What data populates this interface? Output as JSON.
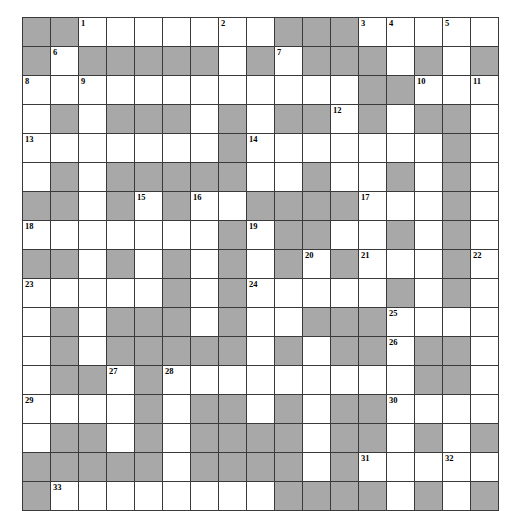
{
  "puzzle": {
    "type": "crossword-grid",
    "columns": 17,
    "rows": 15,
    "colors": {
      "block": "#a8a8a8",
      "open": "#ffffff",
      "grid_line": "#3a3a3a",
      "number_text": "#000000"
    },
    "max_clue_number": 33,
    "grid": [
      [
        {
          "block": true,
          "num": ""
        },
        {
          "block": true,
          "num": ""
        },
        {
          "block": false,
          "num": "1"
        },
        {
          "block": false,
          "num": ""
        },
        {
          "block": false,
          "num": ""
        },
        {
          "block": false,
          "num": ""
        },
        {
          "block": false,
          "num": ""
        },
        {
          "block": false,
          "num": "2"
        },
        {
          "block": false,
          "num": ""
        },
        {
          "block": true,
          "num": ""
        },
        {
          "block": true,
          "num": ""
        },
        {
          "block": true,
          "num": ""
        },
        {
          "block": false,
          "num": "3"
        },
        {
          "block": false,
          "num": "4"
        },
        {
          "block": false,
          "num": ""
        },
        {
          "block": false,
          "num": "5"
        },
        {
          "block": false,
          "num": ""
        }
      ],
      [
        {
          "block": true,
          "num": ""
        },
        {
          "block": false,
          "num": "6"
        },
        {
          "block": true,
          "num": ""
        },
        {
          "block": true,
          "num": ""
        },
        {
          "block": true,
          "num": ""
        },
        {
          "block": true,
          "num": ""
        },
        {
          "block": true,
          "num": ""
        },
        {
          "block": false,
          "num": ""
        },
        {
          "block": true,
          "num": ""
        },
        {
          "block": false,
          "num": "7"
        },
        {
          "block": true,
          "num": ""
        },
        {
          "block": true,
          "num": ""
        },
        {
          "block": true,
          "num": ""
        },
        {
          "block": false,
          "num": ""
        },
        {
          "block": true,
          "num": ""
        },
        {
          "block": false,
          "num": ""
        },
        {
          "block": true,
          "num": ""
        }
      ],
      [
        {
          "block": false,
          "num": "8"
        },
        {
          "block": false,
          "num": ""
        },
        {
          "block": false,
          "num": "9"
        },
        {
          "block": false,
          "num": ""
        },
        {
          "block": false,
          "num": ""
        },
        {
          "block": false,
          "num": ""
        },
        {
          "block": false,
          "num": ""
        },
        {
          "block": false,
          "num": ""
        },
        {
          "block": false,
          "num": ""
        },
        {
          "block": false,
          "num": ""
        },
        {
          "block": false,
          "num": ""
        },
        {
          "block": false,
          "num": ""
        },
        {
          "block": true,
          "num": ""
        },
        {
          "block": true,
          "num": ""
        },
        {
          "block": false,
          "num": "10"
        },
        {
          "block": false,
          "num": ""
        },
        {
          "block": false,
          "num": "11"
        }
      ],
      [
        {
          "block": false,
          "num": ""
        },
        {
          "block": true,
          "num": ""
        },
        {
          "block": false,
          "num": ""
        },
        {
          "block": true,
          "num": ""
        },
        {
          "block": true,
          "num": ""
        },
        {
          "block": true,
          "num": ""
        },
        {
          "block": false,
          "num": ""
        },
        {
          "block": true,
          "num": ""
        },
        {
          "block": false,
          "num": ""
        },
        {
          "block": true,
          "num": ""
        },
        {
          "block": true,
          "num": ""
        },
        {
          "block": false,
          "num": "12"
        },
        {
          "block": true,
          "num": ""
        },
        {
          "block": false,
          "num": ""
        },
        {
          "block": true,
          "num": ""
        },
        {
          "block": true,
          "num": ""
        },
        {
          "block": false,
          "num": ""
        }
      ],
      [
        {
          "block": false,
          "num": "13"
        },
        {
          "block": false,
          "num": ""
        },
        {
          "block": false,
          "num": ""
        },
        {
          "block": false,
          "num": ""
        },
        {
          "block": false,
          "num": ""
        },
        {
          "block": false,
          "num": ""
        },
        {
          "block": false,
          "num": ""
        },
        {
          "block": true,
          "num": ""
        },
        {
          "block": false,
          "num": "14"
        },
        {
          "block": false,
          "num": ""
        },
        {
          "block": false,
          "num": ""
        },
        {
          "block": false,
          "num": ""
        },
        {
          "block": false,
          "num": ""
        },
        {
          "block": false,
          "num": ""
        },
        {
          "block": false,
          "num": ""
        },
        {
          "block": true,
          "num": ""
        },
        {
          "block": false,
          "num": ""
        }
      ],
      [
        {
          "block": false,
          "num": ""
        },
        {
          "block": true,
          "num": ""
        },
        {
          "block": false,
          "num": ""
        },
        {
          "block": true,
          "num": ""
        },
        {
          "block": true,
          "num": ""
        },
        {
          "block": true,
          "num": ""
        },
        {
          "block": true,
          "num": ""
        },
        {
          "block": true,
          "num": ""
        },
        {
          "block": false,
          "num": ""
        },
        {
          "block": false,
          "num": ""
        },
        {
          "block": true,
          "num": ""
        },
        {
          "block": false,
          "num": ""
        },
        {
          "block": false,
          "num": ""
        },
        {
          "block": true,
          "num": ""
        },
        {
          "block": false,
          "num": ""
        },
        {
          "block": true,
          "num": ""
        },
        {
          "block": false,
          "num": ""
        }
      ],
      [
        {
          "block": true,
          "num": ""
        },
        {
          "block": true,
          "num": ""
        },
        {
          "block": false,
          "num": ""
        },
        {
          "block": true,
          "num": ""
        },
        {
          "block": false,
          "num": "15"
        },
        {
          "block": true,
          "num": ""
        },
        {
          "block": false,
          "num": "16"
        },
        {
          "block": false,
          "num": ""
        },
        {
          "block": true,
          "num": ""
        },
        {
          "block": true,
          "num": ""
        },
        {
          "block": true,
          "num": ""
        },
        {
          "block": true,
          "num": ""
        },
        {
          "block": false,
          "num": "17"
        },
        {
          "block": false,
          "num": ""
        },
        {
          "block": false,
          "num": ""
        },
        {
          "block": true,
          "num": ""
        },
        {
          "block": false,
          "num": ""
        }
      ],
      [
        {
          "block": false,
          "num": "18"
        },
        {
          "block": false,
          "num": ""
        },
        {
          "block": false,
          "num": ""
        },
        {
          "block": false,
          "num": ""
        },
        {
          "block": false,
          "num": ""
        },
        {
          "block": false,
          "num": ""
        },
        {
          "block": false,
          "num": ""
        },
        {
          "block": true,
          "num": ""
        },
        {
          "block": false,
          "num": "19"
        },
        {
          "block": true,
          "num": ""
        },
        {
          "block": true,
          "num": ""
        },
        {
          "block": false,
          "num": ""
        },
        {
          "block": false,
          "num": ""
        },
        {
          "block": true,
          "num": ""
        },
        {
          "block": false,
          "num": ""
        },
        {
          "block": true,
          "num": ""
        },
        {
          "block": false,
          "num": ""
        }
      ],
      [
        {
          "block": true,
          "num": ""
        },
        {
          "block": true,
          "num": ""
        },
        {
          "block": false,
          "num": ""
        },
        {
          "block": true,
          "num": ""
        },
        {
          "block": false,
          "num": ""
        },
        {
          "block": true,
          "num": ""
        },
        {
          "block": false,
          "num": ""
        },
        {
          "block": true,
          "num": ""
        },
        {
          "block": false,
          "num": ""
        },
        {
          "block": true,
          "num": ""
        },
        {
          "block": false,
          "num": "20"
        },
        {
          "block": true,
          "num": ""
        },
        {
          "block": false,
          "num": "21"
        },
        {
          "block": false,
          "num": ""
        },
        {
          "block": false,
          "num": ""
        },
        {
          "block": true,
          "num": ""
        },
        {
          "block": false,
          "num": "22"
        }
      ],
      [
        {
          "block": false,
          "num": "23"
        },
        {
          "block": false,
          "num": ""
        },
        {
          "block": false,
          "num": ""
        },
        {
          "block": false,
          "num": ""
        },
        {
          "block": false,
          "num": ""
        },
        {
          "block": true,
          "num": ""
        },
        {
          "block": false,
          "num": ""
        },
        {
          "block": true,
          "num": ""
        },
        {
          "block": false,
          "num": "24"
        },
        {
          "block": false,
          "num": ""
        },
        {
          "block": false,
          "num": ""
        },
        {
          "block": false,
          "num": ""
        },
        {
          "block": false,
          "num": ""
        },
        {
          "block": true,
          "num": ""
        },
        {
          "block": false,
          "num": ""
        },
        {
          "block": true,
          "num": ""
        },
        {
          "block": false,
          "num": ""
        }
      ],
      [
        {
          "block": false,
          "num": ""
        },
        {
          "block": true,
          "num": ""
        },
        {
          "block": false,
          "num": ""
        },
        {
          "block": true,
          "num": ""
        },
        {
          "block": true,
          "num": ""
        },
        {
          "block": true,
          "num": ""
        },
        {
          "block": false,
          "num": ""
        },
        {
          "block": true,
          "num": ""
        },
        {
          "block": false,
          "num": ""
        },
        {
          "block": false,
          "num": ""
        },
        {
          "block": true,
          "num": ""
        },
        {
          "block": true,
          "num": ""
        },
        {
          "block": true,
          "num": ""
        },
        {
          "block": false,
          "num": "25"
        },
        {
          "block": false,
          "num": ""
        },
        {
          "block": false,
          "num": ""
        },
        {
          "block": false,
          "num": ""
        }
      ],
      [
        {
          "block": false,
          "num": ""
        },
        {
          "block": true,
          "num": ""
        },
        {
          "block": false,
          "num": ""
        },
        {
          "block": true,
          "num": ""
        },
        {
          "block": true,
          "num": ""
        },
        {
          "block": true,
          "num": ""
        },
        {
          "block": true,
          "num": ""
        },
        {
          "block": true,
          "num": ""
        },
        {
          "block": false,
          "num": ""
        },
        {
          "block": true,
          "num": ""
        },
        {
          "block": false,
          "num": ""
        },
        {
          "block": true,
          "num": ""
        },
        {
          "block": true,
          "num": ""
        },
        {
          "block": false,
          "num": "26"
        },
        {
          "block": true,
          "num": ""
        },
        {
          "block": true,
          "num": ""
        },
        {
          "block": false,
          "num": ""
        }
      ],
      [
        {
          "block": false,
          "num": ""
        },
        {
          "block": true,
          "num": ""
        },
        {
          "block": true,
          "num": ""
        },
        {
          "block": false,
          "num": "27"
        },
        {
          "block": true,
          "num": ""
        },
        {
          "block": false,
          "num": "28"
        },
        {
          "block": false,
          "num": ""
        },
        {
          "block": false,
          "num": ""
        },
        {
          "block": false,
          "num": ""
        },
        {
          "block": false,
          "num": ""
        },
        {
          "block": false,
          "num": ""
        },
        {
          "block": false,
          "num": ""
        },
        {
          "block": false,
          "num": ""
        },
        {
          "block": false,
          "num": ""
        },
        {
          "block": true,
          "num": ""
        },
        {
          "block": true,
          "num": ""
        },
        {
          "block": false,
          "num": ""
        }
      ],
      [
        {
          "block": false,
          "num": "29"
        },
        {
          "block": false,
          "num": ""
        },
        {
          "block": false,
          "num": ""
        },
        {
          "block": false,
          "num": ""
        },
        {
          "block": true,
          "num": ""
        },
        {
          "block": false,
          "num": ""
        },
        {
          "block": true,
          "num": ""
        },
        {
          "block": true,
          "num": ""
        },
        {
          "block": false,
          "num": ""
        },
        {
          "block": true,
          "num": ""
        },
        {
          "block": false,
          "num": ""
        },
        {
          "block": true,
          "num": ""
        },
        {
          "block": true,
          "num": ""
        },
        {
          "block": false,
          "num": "30"
        },
        {
          "block": false,
          "num": ""
        },
        {
          "block": false,
          "num": ""
        },
        {
          "block": false,
          "num": ""
        }
      ],
      [
        {
          "block": false,
          "num": ""
        },
        {
          "block": true,
          "num": ""
        },
        {
          "block": true,
          "num": ""
        },
        {
          "block": false,
          "num": ""
        },
        {
          "block": true,
          "num": ""
        },
        {
          "block": false,
          "num": ""
        },
        {
          "block": true,
          "num": ""
        },
        {
          "block": true,
          "num": ""
        },
        {
          "block": true,
          "num": ""
        },
        {
          "block": true,
          "num": ""
        },
        {
          "block": false,
          "num": ""
        },
        {
          "block": true,
          "num": ""
        },
        {
          "block": true,
          "num": ""
        },
        {
          "block": false,
          "num": ""
        },
        {
          "block": true,
          "num": ""
        },
        {
          "block": false,
          "num": ""
        },
        {
          "block": true,
          "num": ""
        }
      ],
      [
        {
          "block": true,
          "num": ""
        },
        {
          "block": true,
          "num": ""
        },
        {
          "block": true,
          "num": ""
        },
        {
          "block": true,
          "num": ""
        },
        {
          "block": true,
          "num": ""
        },
        {
          "block": false,
          "num": ""
        },
        {
          "block": true,
          "num": ""
        },
        {
          "block": true,
          "num": ""
        },
        {
          "block": true,
          "num": ""
        },
        {
          "block": true,
          "num": ""
        },
        {
          "block": false,
          "num": ""
        },
        {
          "block": true,
          "num": ""
        },
        {
          "block": false,
          "num": "31"
        },
        {
          "block": false,
          "num": ""
        },
        {
          "block": false,
          "num": ""
        },
        {
          "block": false,
          "num": "32"
        },
        {
          "block": false,
          "num": ""
        }
      ],
      [
        {
          "block": true,
          "num": ""
        },
        {
          "block": false,
          "num": "33"
        },
        {
          "block": false,
          "num": ""
        },
        {
          "block": false,
          "num": ""
        },
        {
          "block": false,
          "num": ""
        },
        {
          "block": false,
          "num": ""
        },
        {
          "block": false,
          "num": ""
        },
        {
          "block": false,
          "num": ""
        },
        {
          "block": false,
          "num": ""
        },
        {
          "block": true,
          "num": ""
        },
        {
          "block": true,
          "num": ""
        },
        {
          "block": true,
          "num": ""
        },
        {
          "block": true,
          "num": ""
        },
        {
          "block": false,
          "num": ""
        },
        {
          "block": true,
          "num": ""
        },
        {
          "block": false,
          "num": ""
        },
        {
          "block": true,
          "num": ""
        }
      ]
    ]
  }
}
